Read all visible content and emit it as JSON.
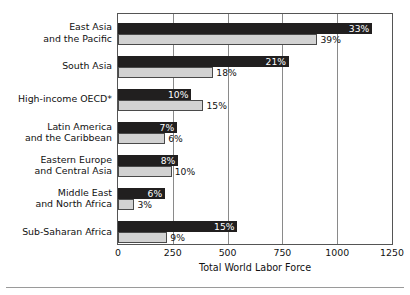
{
  "chart_data": {
    "type": "bar",
    "orientation": "horizontal",
    "title": "",
    "xlabel": "Total World Labor Force",
    "ylabel": "",
    "xlim": [
      0,
      1250
    ],
    "xticks": [
      0,
      250,
      500,
      750,
      1000,
      1250
    ],
    "xtick_labels": [
      "0",
      "250",
      "500",
      "750",
      "1000",
      "1250"
    ],
    "grid": true,
    "legend_position": "bottom-right",
    "categories": [
      "East Asia and the Pacific",
      "South Asia",
      "High-income OECD*",
      "Latin America and the Caribbean",
      "Eastern Europe and Central Asia",
      "Middle East and North Africa",
      "Sub-Saharan Africa"
    ],
    "category_lines": [
      [
        "East Asia",
        "and the Pacific"
      ],
      [
        "South Asia"
      ],
      [
        "High-income OECD*"
      ],
      [
        "Latin America",
        "and the Caribbean"
      ],
      [
        "Eastern Europe",
        "and Central Asia"
      ],
      [
        "Middle East",
        "and North Africa"
      ],
      [
        "Sub-Saharan Africa"
      ]
    ],
    "series": [
      {
        "name": "2025",
        "color": "#211f1f",
        "values": [
          1160,
          780,
          335,
          270,
          275,
          215,
          545
        ],
        "data_labels": [
          "33%",
          "21%",
          "10%",
          "7%",
          "8%",
          "6%",
          "15%"
        ]
      },
      {
        "name": "1995",
        "color": "#d2d2d2",
        "values": [
          910,
          435,
          390,
          215,
          245,
          75,
          225
        ],
        "data_labels": [
          "39%",
          "18%",
          "15%",
          "6%",
          "10%",
          "3%",
          "9%"
        ]
      }
    ]
  },
  "legend": {
    "entries": [
      {
        "label": "2025"
      },
      {
        "label": "1995"
      }
    ]
  }
}
